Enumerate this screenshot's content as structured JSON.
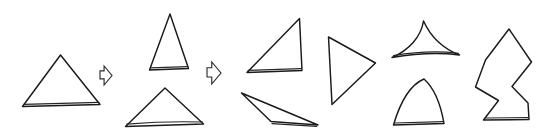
{
  "figure": {
    "title": "Triangle shape transformation sequence",
    "width": 539,
    "height": 139,
    "background_color": "#ffffff",
    "stroke_color": "#1a1a1a",
    "style": "hand-drawn line art, black outlines on white, no fill"
  },
  "groups": [
    {
      "id": "source",
      "name": "source-triangle-group",
      "label": "Source triangle",
      "shape_count": 1
    },
    {
      "id": "arrow-1",
      "name": "transformation-arrow-1",
      "label": "Arrow 1",
      "glyph": "arrow-right-outline-icon",
      "direction": "right"
    },
    {
      "id": "variants",
      "name": "triangle-variants-group",
      "label": "Triangle variants",
      "shape_count": 2
    },
    {
      "id": "arrow-2",
      "name": "transformation-arrow-2",
      "label": "Arrow 2",
      "glyph": "arrow-right-outline-icon",
      "direction": "right"
    },
    {
      "id": "results",
      "name": "transformed-shapes-group",
      "label": "Transformed shapes",
      "shape_count": 6
    }
  ],
  "shapes": [
    {
      "id": "shape-1",
      "name": "equilateral-triangle",
      "label": "Equilateral triangle",
      "group": "source",
      "kind": "polygon",
      "vertices": [
        [
          60.5,
          55.0
        ],
        [
          100.0,
          104.5
        ],
        [
          22.5,
          106.5
        ]
      ],
      "closed": true
    },
    {
      "id": "shape-2",
      "name": "tall-narrow-triangle",
      "label": "Tall narrow triangle",
      "group": "variants",
      "kind": "polygon",
      "vertices": [
        [
          170.0,
          14.0
        ],
        [
          188.5,
          68.5
        ],
        [
          149.5,
          70.0
        ]
      ],
      "closed": true
    },
    {
      "id": "shape-3",
      "name": "wide-flat-triangle",
      "label": "Wide flat triangle",
      "group": "variants",
      "kind": "polygon",
      "vertices": [
        [
          165.0,
          88.0
        ],
        [
          203.5,
          124.0
        ],
        [
          125.5,
          126.5
        ]
      ],
      "closed": true
    },
    {
      "id": "shape-4",
      "name": "right-triangle-upper",
      "label": "Right triangle, apex top right",
      "group": "results",
      "kind": "polygon",
      "vertices": [
        [
          299.5,
          18.5
        ],
        [
          302.0,
          70.5
        ],
        [
          247.0,
          72.5
        ]
      ],
      "closed": true
    },
    {
      "id": "shape-5",
      "name": "sliver-triangle",
      "label": "Thin sliver triangle",
      "group": "results",
      "kind": "polygon",
      "vertices": [
        [
          241.5,
          93.0
        ],
        [
          318.0,
          125.0
        ],
        [
          271.0,
          121.5
        ]
      ],
      "closed": true
    },
    {
      "id": "shape-6",
      "name": "right-pointing-triangle",
      "label": "Right pointing triangle",
      "group": "results",
      "kind": "polygon",
      "vertices": [
        [
          328.5,
          37.0
        ],
        [
          375.5,
          63.0
        ],
        [
          332.0,
          104.5
        ]
      ],
      "closed": true
    },
    {
      "id": "shape-7",
      "name": "concave-spike-shape",
      "label": "Concave spiked shape",
      "group": "results",
      "kind": "curved",
      "apex": [
        423.5,
        21.0
      ],
      "base_left": [
        392.0,
        57.5
      ],
      "base_right": [
        459.5,
        55.0
      ],
      "concavity": "sides curve inward"
    },
    {
      "id": "shape-8",
      "name": "rounded-dome-triangle",
      "label": "Rounded dome triangle",
      "group": "results",
      "kind": "curved",
      "apex": [
        424.0,
        79.0
      ],
      "base_left": [
        393.5,
        125.0
      ],
      "base_right": [
        444.0,
        123.5
      ],
      "concavity": "sides bulge outward"
    },
    {
      "id": "shape-9",
      "name": "concave-notched-polygon",
      "label": "Concave notched polygon",
      "group": "results",
      "kind": "polygon",
      "vertices": [
        [
          509.0,
          29.0
        ],
        [
          531.5,
          62.0
        ],
        [
          512.0,
          86.5
        ],
        [
          528.0,
          103.0
        ],
        [
          529.0,
          119.5
        ],
        [
          483.5,
          120.0
        ],
        [
          498.5,
          100.5
        ],
        [
          475.5,
          87.0
        ],
        [
          485.5,
          60.0
        ]
      ],
      "closed": true
    }
  ],
  "arrows": [
    {
      "id": "arrow-glyph-1",
      "name": "arrow-right-outline-icon",
      "label": "Transformation arrow 1",
      "points_to": "right",
      "position": [
        100.0,
        66.0
      ],
      "size": [
        12.0,
        19.0
      ]
    },
    {
      "id": "arrow-glyph-2",
      "name": "arrow-right-outline-icon",
      "label": "Transformation arrow 2",
      "points_to": "right",
      "position": [
        207.0,
        62.0
      ],
      "size": [
        14.0,
        22.0
      ]
    }
  ]
}
